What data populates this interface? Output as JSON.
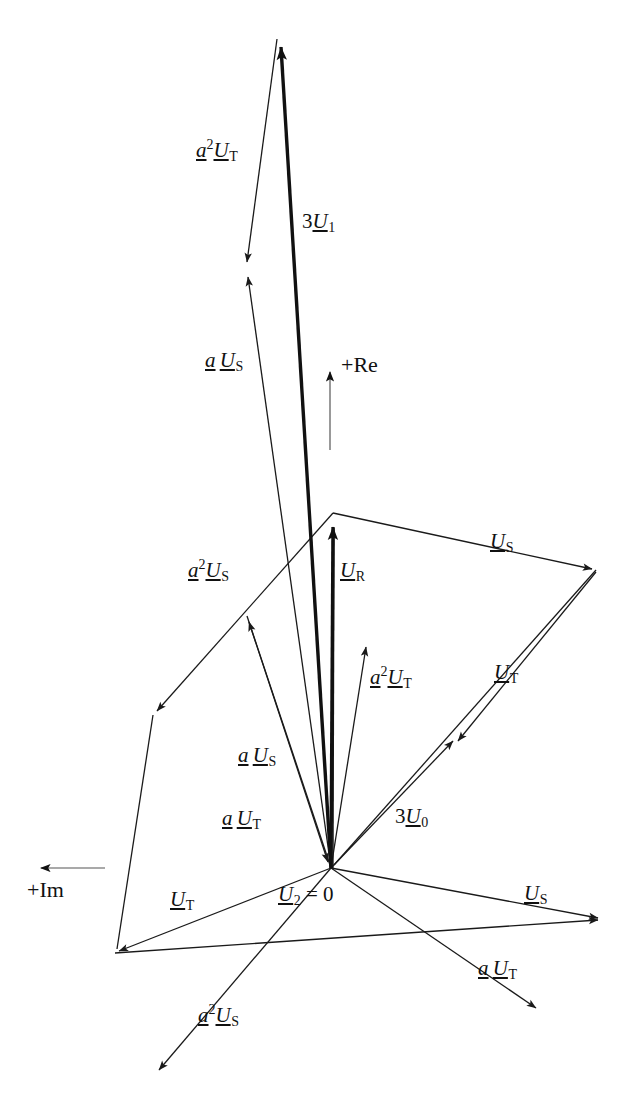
{
  "figure": {
    "type": "phasor-diagram",
    "width": 643,
    "height": 1106,
    "background": "#ffffff",
    "stroke_color": "#1a1a1a",
    "thin_stroke_width": 1.3,
    "thick_stroke_width": 3.4,
    "origin": {
      "x": 331,
      "y": 868,
      "label": "U2 = 0"
    }
  },
  "axes": [
    {
      "name": "real-axis",
      "label": "+Re",
      "direction": "up",
      "tail": {
        "x": 330,
        "y": 450
      },
      "tip": {
        "x": 330,
        "y": 363
      },
      "label_pos": {
        "x": 341,
        "y": 355
      }
    },
    {
      "name": "imaginary-axis",
      "label": "+Im",
      "direction": "left",
      "tail": {
        "x": 105,
        "y": 868
      },
      "tip": {
        "x": 33,
        "y": 868
      },
      "label_pos": {
        "x": 29,
        "y": 880
      }
    }
  ],
  "labels": [
    {
      "id": "a2UT-top",
      "text_parts": [
        "a",
        "2",
        "U",
        "T"
      ],
      "pattern": "a2U_sub",
      "x": 196,
      "y": 138
    },
    {
      "id": "3U1",
      "text_parts": [
        "3",
        "U",
        "1"
      ],
      "pattern": "nU_sub",
      "x": 302,
      "y": 211
    },
    {
      "id": "aUS-top",
      "text_parts": [
        "a",
        "U",
        "S"
      ],
      "pattern": "aU_sub",
      "x": 205,
      "y": 350
    },
    {
      "id": "US-right",
      "text_parts": [
        "U",
        "S"
      ],
      "pattern": "U_sub",
      "x": 490,
      "y": 531
    },
    {
      "id": "a2US-mid",
      "text_parts": [
        "a",
        "2",
        "U",
        "S"
      ],
      "pattern": "a2U_sub",
      "x": 190,
      "y": 558
    },
    {
      "id": "UR",
      "text_parts": [
        "U",
        "R"
      ],
      "pattern": "U_sub",
      "x": 340,
      "y": 560
    },
    {
      "id": "a2UT-mid",
      "text_parts": [
        "a",
        "2",
        "U",
        "T"
      ],
      "pattern": "a2U_sub",
      "x": 372,
      "y": 665
    },
    {
      "id": "UT-right",
      "text_parts": [
        "U",
        "T"
      ],
      "pattern": "U_sub",
      "x": 494,
      "y": 663
    },
    {
      "id": "aUS-mid",
      "text_parts": [
        "a",
        "U",
        "S"
      ],
      "pattern": "aU_sub",
      "x": 238,
      "y": 745
    },
    {
      "id": "aUT-mid",
      "text_parts": [
        "a",
        "U",
        "T"
      ],
      "pattern": "aU_sub",
      "x": 222,
      "y": 808
    },
    {
      "id": "3U0",
      "text_parts": [
        "3",
        "U",
        "0"
      ],
      "pattern": "nU_sub",
      "x": 395,
      "y": 806
    },
    {
      "id": "UT-left",
      "text_parts": [
        "U",
        "T"
      ],
      "pattern": "U_sub",
      "x": 172,
      "y": 890
    },
    {
      "id": "US-lowright",
      "text_parts": [
        "U",
        "S"
      ],
      "pattern": "U_sub",
      "x": 526,
      "y": 884
    },
    {
      "id": "U2eq0",
      "text_parts": [
        "U",
        "2",
        "= 0"
      ],
      "pattern": "U_sub_eq",
      "x": 280,
      "y": 884
    },
    {
      "id": "aUT-low",
      "text_parts": [
        "a",
        "U",
        "T"
      ],
      "pattern": "aU_sub",
      "x": 478,
      "y": 959
    },
    {
      "id": "a2US-low",
      "text_parts": [
        "a",
        "2",
        "U",
        "S"
      ],
      "pattern": "a2U_sub",
      "x": 200,
      "y": 1004
    }
  ],
  "vectors": [
    {
      "name": "3U1",
      "label": "3U1",
      "weight": "thick",
      "tail": {
        "x": 331,
        "y": 868
      },
      "tip": {
        "x": 281,
        "y": 36
      }
    },
    {
      "name": "UR",
      "label": "UR",
      "weight": "thick",
      "tail": {
        "x": 331,
        "y": 868
      },
      "tip": {
        "x": 333,
        "y": 516
      }
    },
    {
      "name": "a2UT-top",
      "label": "a2UT",
      "weight": "thin",
      "tail": {
        "x": 277,
        "y": 39
      },
      "tip": {
        "x": 246,
        "y": 269
      }
    },
    {
      "name": "aUS-top",
      "label": "aUS",
      "weight": "thin",
      "tail": {
        "x": 331,
        "y": 868
      },
      "tip": {
        "x": 246,
        "y": 269
      }
    },
    {
      "name": "US-upper-right",
      "label": "US",
      "weight": "thin",
      "tail": {
        "x": 333,
        "y": 513
      },
      "tip": {
        "x": 596,
        "y": 570
      }
    },
    {
      "name": "UT-right-down",
      "label": "UT",
      "weight": "thin",
      "tail": {
        "x": 596,
        "y": 570
      },
      "tip": {
        "x": 455,
        "y": 744
      }
    },
    {
      "name": "a2US-mid",
      "label": "a2US",
      "weight": "thin",
      "tail": {
        "x": 333,
        "y": 513
      },
      "tip": {
        "x": 153,
        "y": 715
      }
    },
    {
      "name": "a2UT-mid",
      "label": "a2UT",
      "weight": "thin",
      "tail": {
        "x": 331,
        "y": 868
      },
      "tip": {
        "x": 365,
        "y": 641
      }
    },
    {
      "name": "aUS-mid",
      "label": "aUS",
      "weight": "thin",
      "tail": {
        "x": 331,
        "y": 868
      },
      "tip": {
        "x": 247,
        "y": 616
      }
    },
    {
      "name": "aUT-mid",
      "label": "aUT",
      "weight": "thin",
      "tail": {
        "x": 247,
        "y": 616
      },
      "tip": {
        "x": 331,
        "y": 868
      }
    },
    {
      "name": "3U0",
      "label": "3U0",
      "weight": "thin",
      "tail": {
        "x": 331,
        "y": 868
      },
      "tip": {
        "x": 456,
        "y": 738
      }
    },
    {
      "name": "UT-left-lower",
      "label": "UT",
      "weight": "thin",
      "tail": {
        "x": 331,
        "y": 868
      },
      "tip": {
        "x": 115,
        "y": 953
      }
    },
    {
      "name": "US-lower-right",
      "label": "US",
      "weight": "thin",
      "tail": {
        "x": 115,
        "y": 953
      },
      "tip": {
        "x": 602,
        "y": 920
      }
    },
    {
      "name": "a2US-lower",
      "label": "a2US",
      "weight": "thin",
      "tail": {
        "x": 331,
        "y": 868
      },
      "tip": {
        "x": 156,
        "y": 1074
      }
    },
    {
      "name": "aUT-lower",
      "label": "aUT",
      "weight": "thin",
      "tail": {
        "x": 331,
        "y": 868
      },
      "tip": {
        "x": 540,
        "y": 1011
      }
    },
    {
      "name": "US-origin-right",
      "label": "US",
      "weight": "thin",
      "tail": {
        "x": 331,
        "y": 868
      },
      "tip": {
        "x": 602,
        "y": 920
      }
    },
    {
      "name": "UT-upperleft-edge",
      "label": "UT",
      "weight": "thin",
      "tail": {
        "x": 153,
        "y": 715
      },
      "tip": {
        "x": 115,
        "y": 953
      }
    },
    {
      "name": "a2UT-through",
      "label": "a2UT",
      "weight": "thin",
      "tail": {
        "x": 596,
        "y": 570
      },
      "tip": {
        "x": 331,
        "y": 868
      }
    },
    {
      "name": "UR-tail-thin",
      "label": "UR-stem",
      "weight": "thin",
      "tail": {
        "x": 331,
        "y": 868
      },
      "tip": {
        "x": 340,
        "y": 515
      }
    }
  ]
}
